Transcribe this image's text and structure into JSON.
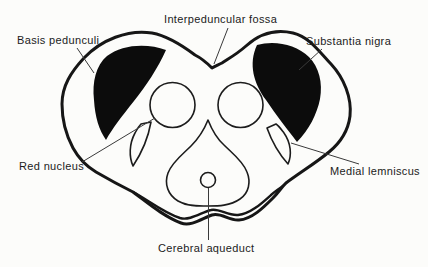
{
  "figure": {
    "labels": {
      "interpeduncular_fossa": "Interpeduncular fossa",
      "basis_pedunculi": "Basis pedunculi",
      "substantia_nigra": "Substantia nigra",
      "red_nucleus": "Red nucleus",
      "medial_lemniscus": "Medial lemniscus",
      "cerebral_aqueduct": "Cerebral aqueduct"
    },
    "colors": {
      "ink": "#161616",
      "dark_region_fill": "#0c0c0c",
      "background": "#fcfcfa",
      "leader_line": "#3a3a3a"
    }
  }
}
